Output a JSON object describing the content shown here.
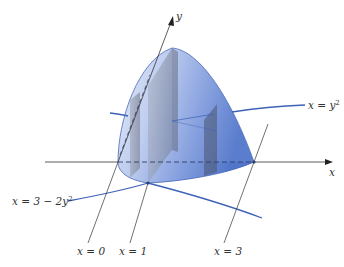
{
  "figure": {
    "colors": {
      "surface_light": "#dfe7f7",
      "surface_mid": "#9fb4e4",
      "surface_dark": "#4d72c9",
      "surface_edge": "#3a5fb5",
      "curve": "#3e62b8",
      "slab": "#8d93a3",
      "slab_dark": "#5d6577",
      "axis": "#333333"
    },
    "axes": {
      "x_label": "x",
      "y_label": "y"
    },
    "curves": {
      "upper": {
        "lhs": "x = y",
        "exp": "2"
      },
      "lower": {
        "lhs": "x = 3 − 2y",
        "exp": "2"
      }
    },
    "sections": [
      {
        "label": "x = 0"
      },
      {
        "label": "x = 1"
      },
      {
        "label": "x = 3"
      }
    ]
  }
}
